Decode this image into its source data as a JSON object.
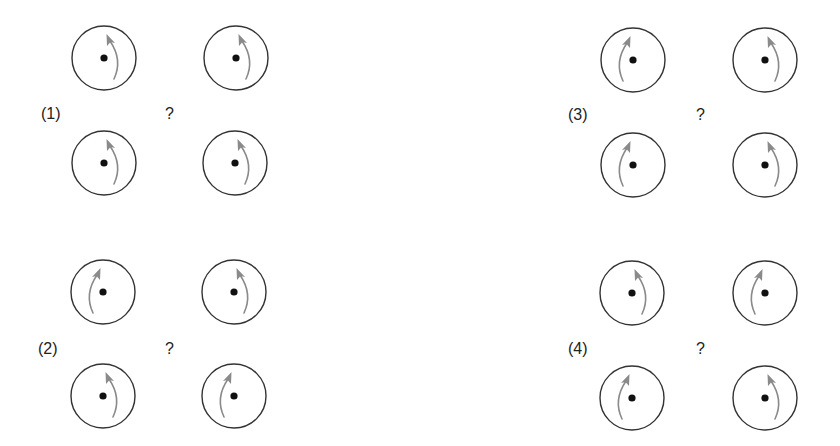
{
  "figure": {
    "colors": {
      "circle_stroke": "#333333",
      "dot_fill": "#111111",
      "arrow_color": "#8a8a8a",
      "text_color": "#222222"
    },
    "circle_radius": 32,
    "dot_radius": 3.6
  },
  "groups": [
    {
      "label": "(1)",
      "question": "?",
      "label_pos": [
        41,
        105
      ],
      "question_pos": [
        165,
        105
      ],
      "circles": [
        {
          "position": "top-left",
          "cx": 104,
          "cy": 58,
          "arrow_side": "right",
          "rotation": "counterclockwise"
        },
        {
          "position": "top-right",
          "cx": 236,
          "cy": 58,
          "arrow_side": "right",
          "rotation": "counterclockwise"
        },
        {
          "position": "bottom-left",
          "cx": 104,
          "cy": 163,
          "arrow_side": "right",
          "rotation": "counterclockwise"
        },
        {
          "position": "bottom-right",
          "cx": 235,
          "cy": 163,
          "arrow_side": "right",
          "rotation": "counterclockwise"
        }
      ]
    },
    {
      "label": "(2)",
      "question": "?",
      "label_pos": [
        38,
        340
      ],
      "question_pos": [
        165,
        340
      ],
      "circles": [
        {
          "position": "top-left",
          "cx": 103,
          "cy": 292,
          "arrow_side": "left",
          "rotation": "clockwise"
        },
        {
          "position": "top-right",
          "cx": 234,
          "cy": 292,
          "arrow_side": "right",
          "rotation": "counterclockwise"
        },
        {
          "position": "bottom-left",
          "cx": 103,
          "cy": 396,
          "arrow_side": "right",
          "rotation": "counterclockwise"
        },
        {
          "position": "bottom-right",
          "cx": 234,
          "cy": 396,
          "arrow_side": "left",
          "rotation": "clockwise"
        }
      ]
    },
    {
      "label": "(3)",
      "question": "?",
      "label_pos": [
        568,
        106
      ],
      "question_pos": [
        696,
        106
      ],
      "circles": [
        {
          "position": "top-left",
          "cx": 633,
          "cy": 60,
          "arrow_side": "left",
          "rotation": "clockwise"
        },
        {
          "position": "top-right",
          "cx": 765,
          "cy": 60,
          "arrow_side": "right",
          "rotation": "counterclockwise"
        },
        {
          "position": "bottom-left",
          "cx": 633,
          "cy": 165,
          "arrow_side": "left",
          "rotation": "clockwise"
        },
        {
          "position": "bottom-right",
          "cx": 765,
          "cy": 165,
          "arrow_side": "right",
          "rotation": "counterclockwise"
        }
      ]
    },
    {
      "label": "(4)",
      "question": "?",
      "label_pos": [
        568,
        340
      ],
      "question_pos": [
        696,
        340
      ],
      "circles": [
        {
          "position": "top-left",
          "cx": 632,
          "cy": 293,
          "arrow_side": "right",
          "rotation": "counterclockwise"
        },
        {
          "position": "top-right",
          "cx": 765,
          "cy": 293,
          "arrow_side": "left",
          "rotation": "clockwise"
        },
        {
          "position": "bottom-left",
          "cx": 632,
          "cy": 398,
          "arrow_side": "left",
          "rotation": "clockwise"
        },
        {
          "position": "bottom-right",
          "cx": 765,
          "cy": 398,
          "arrow_side": "right",
          "rotation": "counterclockwise"
        }
      ]
    }
  ]
}
